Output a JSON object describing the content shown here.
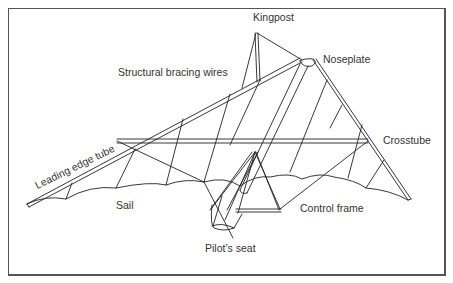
{
  "diagram": {
    "labels": {
      "kingpost": "Kingpost",
      "noseplate": "Noseplate",
      "bracing_wires": "Structural bracing wires",
      "crosstube": "Crosstube",
      "leading_edge_tube": "Leading edge tube",
      "sail": "Sail",
      "control_frame": "Control frame",
      "pilots_seat": "Pilot’s seat"
    },
    "colors": {
      "line": "#222222",
      "text": "#333333",
      "border": "#555555",
      "background": "#ffffff"
    }
  }
}
